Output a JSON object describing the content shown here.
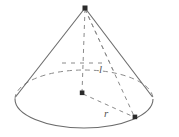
{
  "figure": {
    "name": "right-circular-cone",
    "background_color": "#ffffff",
    "stroke_color": "#6b6b6b",
    "dash_color": "#8a8a8a",
    "vertex_color": "#2b2b2b",
    "labels": {
      "slant_height": "l",
      "radius": "r"
    },
    "points": {
      "apex": {
        "x": 85,
        "y": 8,
        "name": "apex-vertex"
      },
      "base_center": {
        "x": 82,
        "y": 93,
        "name": "base-center-vertex"
      },
      "base_rim_point": {
        "x": 135,
        "y": 117,
        "name": "base-rim-vertex"
      }
    },
    "base_ellipse": {
      "center_x": 84,
      "center_y": 99,
      "radius_x": 69,
      "radius_y": 29
    },
    "segments": [
      {
        "name": "left-slant-edge",
        "style": "solid"
      },
      {
        "name": "right-slant-edge",
        "style": "solid"
      },
      {
        "name": "base-front-arc",
        "style": "solid"
      },
      {
        "name": "base-back-arc",
        "style": "dashed"
      },
      {
        "name": "cone-axis",
        "style": "dashed"
      },
      {
        "name": "slant-height-line",
        "style": "dashed"
      },
      {
        "name": "radius-line",
        "style": "dashed"
      },
      {
        "name": "back-rim-helper-line",
        "style": "dashed"
      },
      {
        "name": "center-horizontal-helper-line",
        "style": "dashed"
      }
    ]
  }
}
